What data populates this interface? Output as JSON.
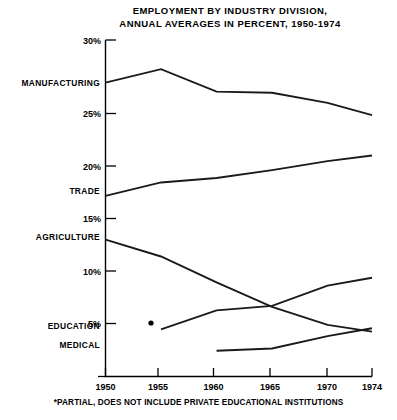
{
  "title": {
    "line1": "EMPLOYMENT BY INDUSTRY DIVISION,",
    "line2": "ANNUAL AVERAGES IN PERCENT, 1950-1974"
  },
  "footnote": "*PARTIAL, DOES NOT INCLUDE PRIVATE EDUCATIONAL INSTITUTIONS",
  "axes": {
    "y_ticks": [
      "5%",
      "10%",
      "15%",
      "20%",
      "25%",
      "30%"
    ],
    "x_ticks": [
      "1950",
      "1955",
      "1960",
      "1965",
      "1970",
      "1974"
    ]
  },
  "series_labels": {
    "manufacturing": "MANUFACTURING",
    "trade": "TRADE",
    "agriculture": "AGRICULTURE",
    "education": "EDUCATION",
    "medical": "MEDICAL"
  },
  "chart_data": {
    "type": "line",
    "title": "EMPLOYMENT BY INDUSTRY DIVISION, ANNUAL AVERAGES IN PERCENT, 1950-1974",
    "xlabel": "",
    "ylabel": "",
    "x": [
      1950,
      1955,
      1960,
      1965,
      1970,
      1974
    ],
    "xlim": [
      1950,
      1974
    ],
    "ylim": [
      0,
      30
    ],
    "ytick_values": [
      5,
      10,
      15,
      20,
      25,
      30
    ],
    "grid": false,
    "legend": "inline-left-labels",
    "annotations": [
      {
        "text": "*",
        "series": "EDUCATION",
        "x": 1955,
        "y": 4.2,
        "note": "*PARTIAL, DOES NOT INCLUDE PRIVATE EDUCATIONAL INSTITUTIONS"
      }
    ],
    "series": [
      {
        "name": "MANUFACTURING",
        "x": [
          1950,
          1955,
          1960,
          1965,
          1970,
          1974
        ],
        "values": [
          26.2,
          27.4,
          25.4,
          25.3,
          24.4,
          23.3
        ]
      },
      {
        "name": "TRADE",
        "x": [
          1950,
          1955,
          1960,
          1965,
          1970,
          1974
        ],
        "values": [
          16.1,
          17.3,
          17.7,
          18.4,
          19.2,
          19.7
        ]
      },
      {
        "name": "AGRICULTURE",
        "x": [
          1950,
          1955,
          1960,
          1965,
          1970,
          1974
        ],
        "values": [
          12.2,
          10.7,
          8.4,
          6.2,
          4.6,
          4.0
        ]
      },
      {
        "name": "EDUCATION",
        "x": [
          1955,
          1960,
          1965,
          1970,
          1974
        ],
        "values": [
          4.2,
          5.9,
          6.3,
          8.1,
          8.8
        ]
      },
      {
        "name": "MEDICAL",
        "x": [
          1960,
          1965,
          1970,
          1974
        ],
        "values": [
          2.3,
          2.5,
          3.6,
          4.3
        ]
      }
    ]
  }
}
